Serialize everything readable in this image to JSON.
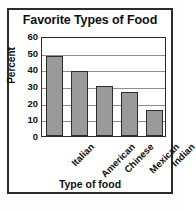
{
  "chart_data": {
    "type": "bar",
    "title": "Favorite Types of Food",
    "xlabel": "Type of food",
    "ylabel": "Percent",
    "categories": [
      "Italian",
      "American",
      "Chinese",
      "Mexican",
      "Indian"
    ],
    "values": [
      48,
      39,
      30,
      26.5,
      15.5
    ],
    "ylim": [
      0,
      60
    ],
    "yticks": [
      60,
      50,
      40,
      30,
      20,
      10,
      0
    ],
    "grid": true,
    "legend": false,
    "bar_color": "#9a9a9a",
    "bar_edge_color": "#2d2d2d",
    "axis_color": "#2b2b2b",
    "grid_color": "#8d8d8d",
    "text_color": "#111111",
    "background": "#ffffff"
  }
}
